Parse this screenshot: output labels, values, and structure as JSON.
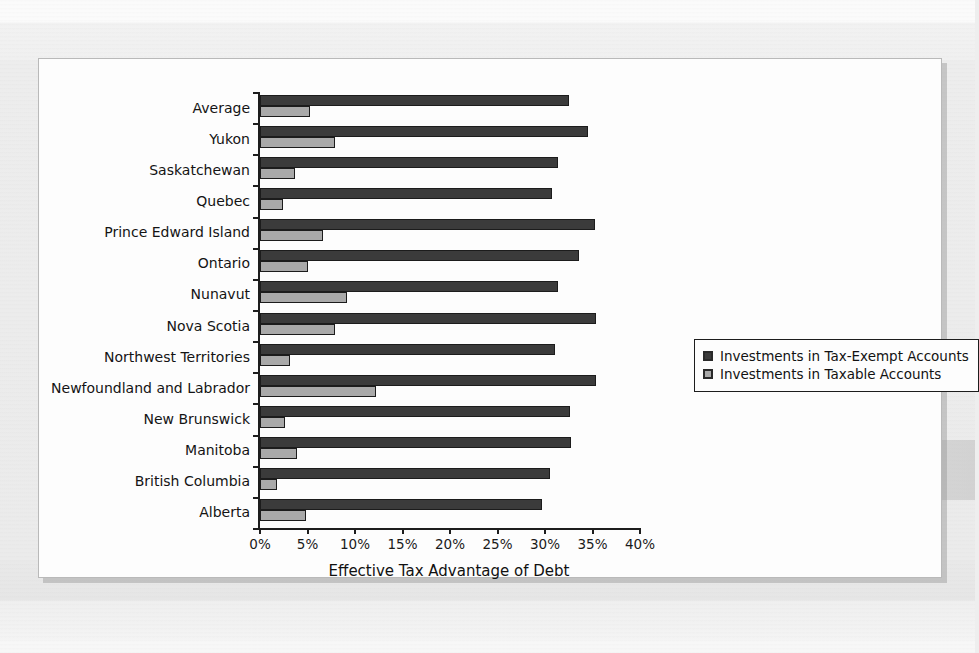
{
  "chart_data": {
    "type": "bar",
    "orientation": "horizontal",
    "title": "",
    "xlabel": "Effective Tax Advantage of Debt",
    "ylabel": "",
    "xlim": [
      0,
      40
    ],
    "xtick_labels": [
      "0%",
      "5%",
      "10%",
      "15%",
      "20%",
      "25%",
      "30%",
      "35%",
      "40%"
    ],
    "xtick_values": [
      0,
      5,
      10,
      15,
      20,
      25,
      30,
      35,
      40
    ],
    "grid": false,
    "legend_position": "right",
    "categories": [
      "Average",
      "Yukon",
      "Saskatchewan",
      "Quebec",
      "Prince Edward Island",
      "Ontario",
      "Nunavut",
      "Nova Scotia",
      "Northwest Territories",
      "Newfoundland and Labrador",
      "New Brunswick",
      "Manitoba",
      "British Columbia",
      "Alberta"
    ],
    "series": [
      {
        "name": "Investments in Tax-Exempt Accounts",
        "color": "#3b3b3b",
        "values": [
          32.5,
          34.5,
          31.4,
          30.7,
          35.3,
          33.6,
          31.4,
          35.4,
          31.1,
          35.4,
          32.6,
          32.7,
          30.5,
          29.7
        ]
      },
      {
        "name": "Investments in Taxable Accounts",
        "color": "#a9a9a9",
        "values": [
          5.3,
          7.9,
          3.7,
          2.4,
          6.6,
          5.0,
          9.1,
          7.9,
          3.2,
          12.2,
          2.6,
          3.9,
          1.8,
          4.8
        ]
      }
    ]
  },
  "legend": {
    "items": [
      {
        "label": "Investments in Tax-Exempt Accounts",
        "swatch": "exempt"
      },
      {
        "label": "Investments in Taxable Accounts",
        "swatch": "taxable"
      }
    ]
  },
  "colors": {
    "tax_exempt": "#3b3b3b",
    "taxable": "#a9a9a9",
    "axis": "#1d1d1d",
    "panel": "#fdfdfd",
    "page": "#eeeeee"
  }
}
